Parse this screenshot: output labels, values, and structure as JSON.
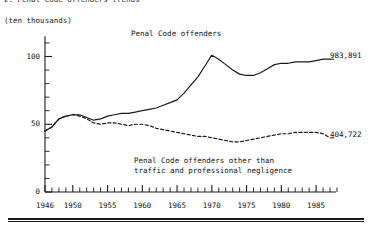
{
  "figure": {
    "title": "2. Penal Code offenders trends",
    "unit_label": "(ten thousands)"
  },
  "annotations": {
    "upper_series_label": "Penal Code offenders",
    "lower_series_label_line1": "Penal Code offenders other than",
    "lower_series_label_line2": "traffic and professional negligence",
    "upper_end_value_label": "983,891",
    "lower_end_value_label": "404,722"
  },
  "axes": {
    "y_tick_labels": [
      "0",
      "50",
      "100"
    ],
    "x_tick_labels": [
      "1946",
      "1950",
      "1955",
      "1960",
      "1965",
      "1970",
      "1975",
      "1980",
      "1985"
    ]
  },
  "chart_data": {
    "type": "line",
    "title": "2. Penal Code offenders trends",
    "xlabel": "",
    "ylabel": "(ten thousands)",
    "xlim": [
      1946,
      1988
    ],
    "ylim": [
      0,
      115
    ],
    "grid": false,
    "legend": "inline-annotations",
    "y_ticks_major": [
      0,
      50,
      100
    ],
    "y_ticks_minor_step": 10,
    "x_ticks_labeled": [
      1946,
      1950,
      1955,
      1960,
      1965,
      1970,
      1975,
      1980,
      1985
    ],
    "x_ticks_minor_step": 1,
    "x": [
      1946,
      1947,
      1948,
      1949,
      1950,
      1951,
      1952,
      1953,
      1954,
      1955,
      1956,
      1957,
      1958,
      1959,
      1960,
      1961,
      1962,
      1963,
      1964,
      1965,
      1966,
      1967,
      1968,
      1969,
      1970,
      1971,
      1972,
      1973,
      1974,
      1975,
      1976,
      1977,
      1978,
      1979,
      1980,
      1981,
      1982,
      1983,
      1984,
      1985,
      1986,
      1987
    ],
    "series": [
      {
        "name": "Penal Code offenders",
        "style": "solid",
        "end_value_label": "983,891",
        "values": [
          45,
          48,
          54,
          56,
          57,
          57,
          55,
          53,
          54,
          56,
          57,
          58,
          58,
          59,
          60,
          61,
          62,
          64,
          66,
          68,
          73,
          79,
          85,
          93,
          101,
          98,
          94,
          90,
          87,
          86,
          86,
          88,
          91,
          94,
          95,
          95,
          96,
          96,
          96,
          97,
          98,
          98
        ]
      },
      {
        "name": "Penal Code offenders other than traffic and professional negligence",
        "style": "dashed",
        "end_value_label": "404,722",
        "values": [
          45,
          48,
          54,
          56,
          57,
          56,
          54,
          51,
          50,
          51,
          51,
          50,
          49,
          50,
          50,
          49,
          47,
          46,
          45,
          44,
          43,
          42,
          41,
          41,
          40,
          39,
          38,
          37,
          37,
          38,
          39,
          40,
          41,
          42,
          43,
          43,
          44,
          44,
          44,
          44,
          43,
          40
        ]
      }
    ]
  }
}
